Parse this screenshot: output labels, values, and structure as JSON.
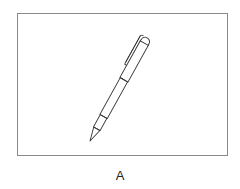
{
  "figure": {
    "label": "A",
    "colors": {
      "frame_border": "#8a8a8a",
      "stroke": "#333333",
      "background": "#ffffff"
    }
  }
}
